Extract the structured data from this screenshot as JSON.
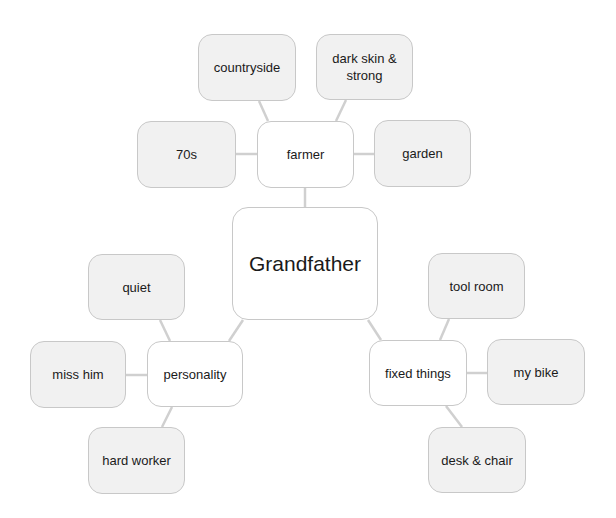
{
  "diagram": {
    "root": {
      "label": "Grandfather"
    },
    "branches": [
      {
        "label": "farmer",
        "children": [
          "countryside",
          "dark skin & strong",
          "70s",
          "garden"
        ]
      },
      {
        "label": "personality",
        "children": [
          "quiet",
          "miss him",
          "hard worker"
        ]
      },
      {
        "label": "fixed things",
        "children": [
          "tool room",
          "my bike",
          "desk & chair"
        ]
      }
    ]
  },
  "colors": {
    "leaf_fill": "#f1f1f1",
    "hub_fill": "#ffffff",
    "border": "#c8c8c8",
    "connector": "#d0d0d0"
  }
}
